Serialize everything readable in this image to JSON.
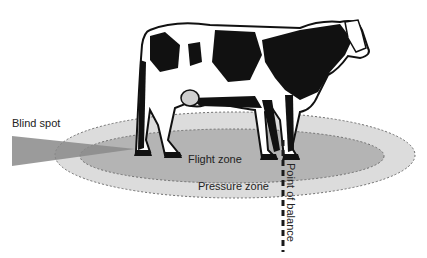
{
  "diagram": {
    "labels": {
      "blind_spot": "Blind spot",
      "flight_zone": "Flight zone",
      "pressure_zone": "Pressure zone",
      "point_of_balance": "Point of balance"
    },
    "colors": {
      "background": "#ffffff",
      "pressure_zone_fill": "#dcdcdc",
      "flight_zone_fill": "#b4b4b4",
      "blind_spot_fill": "#8a8a8a",
      "zone_outline": "#6e6e6e",
      "balance_line": "#1a1a1a",
      "cow_black": "#111111",
      "cow_white": "#ffffff"
    }
  }
}
